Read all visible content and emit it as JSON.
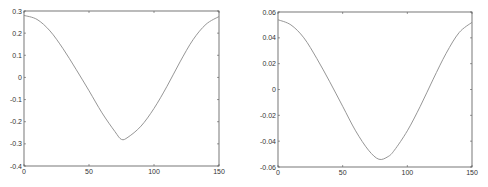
{
  "chart_data": [
    {
      "type": "line",
      "title": "",
      "xlabel": "",
      "ylabel": "",
      "xlim": [
        0,
        150
      ],
      "ylim": [
        -0.4,
        0.3
      ],
      "grid": false,
      "xticks": [
        "0",
        "50",
        "100",
        "150"
      ],
      "yticks": [
        "-0.4",
        "-0.3",
        "-0.2",
        "-0.1",
        "0",
        "0.1",
        "0.2",
        "0.3"
      ],
      "series": [
        {
          "name": "curve",
          "x": [
            0,
            10,
            20,
            30,
            40,
            50,
            60,
            70,
            75,
            80,
            90,
            100,
            110,
            120,
            130,
            140,
            150
          ],
          "y": [
            0.28,
            0.262,
            0.21,
            0.13,
            0.037,
            -0.06,
            -0.16,
            -0.245,
            -0.28,
            -0.27,
            -0.22,
            -0.14,
            -0.04,
            0.07,
            0.17,
            0.24,
            0.275
          ]
        }
      ],
      "line_color": "#8a8a8a"
    },
    {
      "type": "line",
      "title": "",
      "xlabel": "",
      "ylabel": "",
      "xlim": [
        0,
        150
      ],
      "ylim": [
        -0.06,
        0.06
      ],
      "grid": false,
      "xticks": [
        "0",
        "50",
        "100",
        "150"
      ],
      "yticks": [
        "-0.06",
        "-0.04",
        "-0.02",
        "0",
        "0.02",
        "0.04",
        "0.06"
      ],
      "series": [
        {
          "name": "curve",
          "x": [
            0,
            10,
            20,
            30,
            40,
            50,
            60,
            70,
            78,
            85,
            90,
            100,
            110,
            120,
            130,
            140,
            150
          ],
          "y": [
            0.054,
            0.05,
            0.04,
            0.024,
            0.006,
            -0.013,
            -0.032,
            -0.047,
            -0.054,
            -0.052,
            -0.047,
            -0.032,
            -0.013,
            0.008,
            0.028,
            0.044,
            0.052
          ]
        }
      ],
      "line_color": "#8a8a8a"
    }
  ]
}
